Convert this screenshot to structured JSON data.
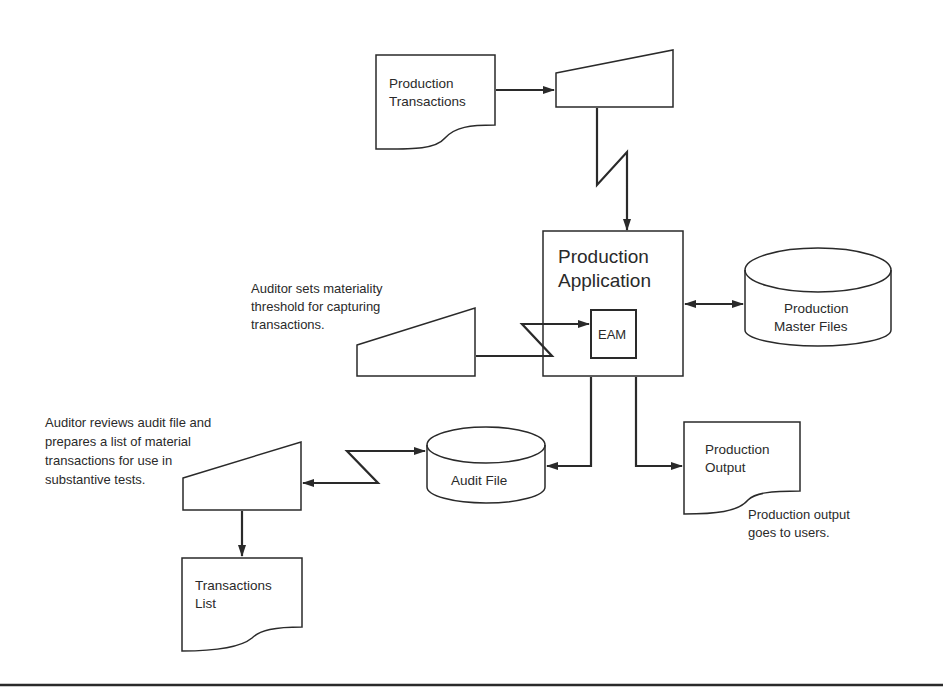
{
  "nodes": {
    "production_transactions": {
      "line1": "Production",
      "line2": "Transactions"
    },
    "terminal_top": {},
    "production_application": {
      "line1": "Production",
      "line2": "Application"
    },
    "eam": {
      "label": "EAM"
    },
    "master_files": {
      "line1": "Production",
      "line2": "Master Files"
    },
    "audit_file": {
      "label": "Audit File"
    },
    "production_output": {
      "line1": "Production",
      "line2": "Output"
    },
    "transactions_list": {
      "line1": "Transactions",
      "line2": "List"
    }
  },
  "annotations": {
    "materiality": [
      "Auditor sets materiality",
      "threshold for capturing",
      "transactions."
    ],
    "review": [
      "Auditor reviews audit file and",
      "prepares a list of material",
      "transactions for use in",
      "substantive tests."
    ],
    "output": [
      "Production output",
      "goes to users."
    ]
  },
  "colors": {
    "stroke": "#2a2a2a",
    "background": "#ffffff"
  }
}
